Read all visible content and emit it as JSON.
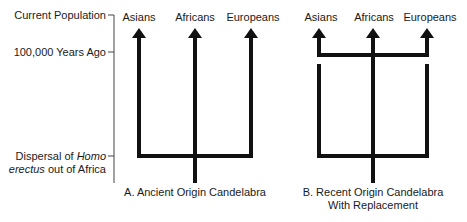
{
  "axis": {
    "labels": {
      "current": "Current Population",
      "years_ago": "100,000 Years Ago",
      "dispersal_prefix": "Dispersal of ",
      "dispersal_italic1": "Homo",
      "dispersal_italic2": "erectus",
      "dispersal_suffix": " out of Africa"
    }
  },
  "diagram_a": {
    "populations": [
      "Asians",
      "Africans",
      "Europeans"
    ],
    "caption": "A. Ancient Origin Candelabra"
  },
  "diagram_b": {
    "populations": [
      "Asians",
      "Africans",
      "Europeans"
    ],
    "caption_line1": "B. Recent Origin Candelabra",
    "caption_line2": "With Replacement"
  },
  "colors": {
    "line": "#111111",
    "axis": "#444444"
  }
}
